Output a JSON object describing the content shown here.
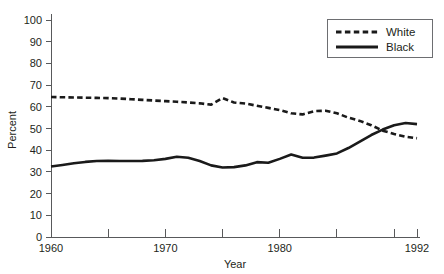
{
  "chart_data": {
    "type": "line",
    "title": "",
    "xlabel": "Year",
    "ylabel": "Percent",
    "xlim": [
      1960,
      1992
    ],
    "ylim": [
      0,
      100
    ],
    "grid": false,
    "legend_position": "top-right",
    "y_ticks": [
      0,
      10,
      20,
      30,
      40,
      50,
      60,
      70,
      80,
      90,
      100
    ],
    "y_tick_labels": [
      "0",
      "10",
      "20",
      "30",
      "40",
      "50",
      "60",
      "70",
      "80",
      "90",
      "100"
    ],
    "x_ticks": [
      1960,
      1965,
      1970,
      1975,
      1980,
      1985,
      1990,
      1992
    ],
    "x_tick_labels": [
      "1960",
      "",
      "1970",
      "",
      "1980",
      "",
      "",
      "1992"
    ],
    "x_labeled_ticks": [
      {
        "value": 1960,
        "label": "1960"
      },
      {
        "value": 1970,
        "label": "1970"
      },
      {
        "value": 1980,
        "label": "1980"
      },
      {
        "value": 1992,
        "label": "1992"
      }
    ],
    "series": [
      {
        "name": "White",
        "style": "dashed",
        "color": "#1a1a1a",
        "x": [
          1960,
          1961,
          1962,
          1963,
          1964,
          1965,
          1966,
          1967,
          1968,
          1969,
          1970,
          1971,
          1972,
          1973,
          1974,
          1975,
          1976,
          1977,
          1978,
          1979,
          1980,
          1981,
          1982,
          1983,
          1984,
          1985,
          1986,
          1987,
          1988,
          1989,
          1990,
          1991,
          1992
        ],
        "values": [
          64.5,
          64.4,
          64.3,
          64.2,
          64.1,
          64.0,
          63.8,
          63.5,
          63.2,
          62.9,
          62.6,
          62.3,
          62.0,
          61.6,
          61.0,
          64.0,
          62.0,
          61.5,
          60.5,
          59.5,
          58.5,
          57.0,
          56.5,
          58.0,
          58.2,
          57.0,
          55.0,
          53.5,
          51.5,
          49.0,
          47.5,
          46.2,
          45.5
        ]
      },
      {
        "name": "Black",
        "style": "solid",
        "color": "#1a1a1a",
        "x": [
          1960,
          1961,
          1962,
          1963,
          1964,
          1965,
          1966,
          1967,
          1968,
          1969,
          1970,
          1971,
          1972,
          1973,
          1974,
          1975,
          1976,
          1977,
          1978,
          1979,
          1980,
          1981,
          1982,
          1983,
          1984,
          1985,
          1986,
          1987,
          1988,
          1989,
          1990,
          1991,
          1992
        ],
        "values": [
          32.5,
          33.2,
          34.0,
          34.6,
          35.0,
          35.1,
          35.0,
          35.0,
          35.1,
          35.4,
          36.0,
          37.0,
          36.5,
          35.0,
          33.0,
          32.0,
          32.2,
          33.0,
          34.5,
          34.2,
          36.0,
          38.0,
          36.5,
          36.6,
          37.5,
          38.5,
          41.0,
          44.0,
          47.0,
          49.5,
          51.5,
          52.5,
          52.0
        ]
      }
    ],
    "legend_entries": [
      {
        "label": "White",
        "style": "dashed"
      },
      {
        "label": "Black",
        "style": "solid"
      }
    ]
  }
}
